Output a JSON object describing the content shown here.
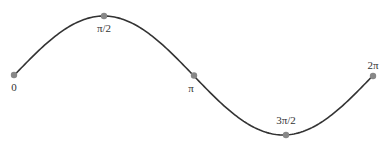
{
  "diagram": {
    "type": "sine-curve",
    "colors": {
      "curve": "#333333",
      "point": "#888888",
      "label": "#333333",
      "background": "#ffffff"
    },
    "points": [
      {
        "label": "0",
        "x": 14,
        "y": 75,
        "lx": 14,
        "ly": 91,
        "anchor": "middle"
      },
      {
        "label": "π/2",
        "x": 104,
        "y": 16,
        "lx": 104,
        "ly": 32,
        "anchor": "middle"
      },
      {
        "label": "π",
        "x": 194,
        "y": 76,
        "lx": 191,
        "ly": 92,
        "anchor": "middle"
      },
      {
        "label": "3π/2",
        "x": 286,
        "y": 135,
        "lx": 286,
        "ly": 124,
        "anchor": "middle"
      },
      {
        "label": "2π",
        "x": 373,
        "y": 76,
        "lx": 373,
        "ly": 69,
        "anchor": "middle"
      }
    ]
  }
}
